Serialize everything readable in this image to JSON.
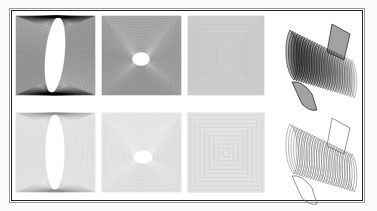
{
  "figure": {
    "rows": [
      {
        "row": 1,
        "style": "filled-gray-dense",
        "panels": [
          {
            "id": "r1c1",
            "kind": "square-to-ellipse-sweep",
            "hole": "tall-ellipse",
            "shading": "dark"
          },
          {
            "id": "r1c2",
            "kind": "square-to-ellipse-sweep",
            "hole": "small-ellipse",
            "shading": "dark"
          },
          {
            "id": "r1c3",
            "kind": "nested-squares",
            "hole": "none",
            "shading": "dark"
          },
          {
            "id": "r1c4",
            "kind": "3d-swept-surface",
            "hole": "none",
            "shading": "dark"
          }
        ]
      },
      {
        "row": 2,
        "style": "outline-light",
        "panels": [
          {
            "id": "r2c1",
            "kind": "square-to-ellipse-sweep",
            "hole": "tall-ellipse",
            "shading": "outline"
          },
          {
            "id": "r2c2",
            "kind": "square-to-ellipse-sweep",
            "hole": "small-ellipse",
            "shading": "outline"
          },
          {
            "id": "r2c3",
            "kind": "nested-squares",
            "hole": "none",
            "shading": "outline"
          },
          {
            "id": "r2c4",
            "kind": "3d-swept-surface",
            "hole": "none",
            "shading": "outline"
          }
        ]
      }
    ],
    "colors": {
      "frame_outer": "#9a9a9a",
      "frame_inner": "#222222",
      "line_dark": "#000000",
      "line_light": "#8a8a8a"
    }
  }
}
